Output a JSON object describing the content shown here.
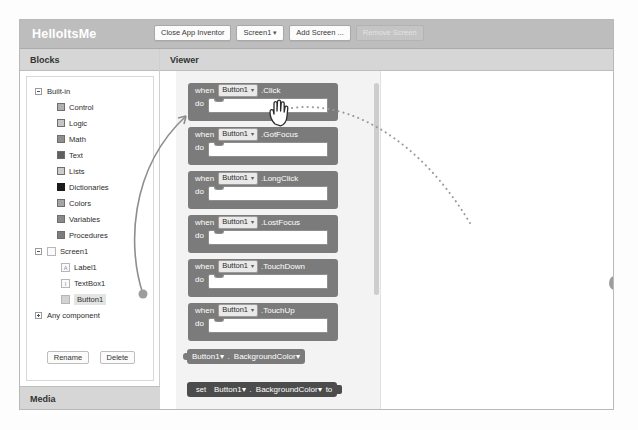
{
  "header": {
    "project_title": "HelloItsMe",
    "toolbar": [
      {
        "label": "Close App Inventor",
        "type": "button",
        "disabled": false
      },
      {
        "label": "Screen1",
        "type": "dropdown",
        "disabled": false
      },
      {
        "label": "Add Screen ...",
        "type": "button",
        "disabled": false
      },
      {
        "label": "Remove Screen",
        "type": "button",
        "disabled": true
      }
    ]
  },
  "blocks_panel": {
    "title": "Blocks",
    "tree": [
      {
        "label": "Built-in",
        "level": 0,
        "toggle": "minus"
      },
      {
        "label": "Control",
        "level": 1,
        "color": "#b0b0b0"
      },
      {
        "label": "Logic",
        "level": 1,
        "color": "#c6c6c6"
      },
      {
        "label": "Math",
        "level": 1,
        "color": "#8f8f8f"
      },
      {
        "label": "Text",
        "level": 1,
        "color": "#5f5f5f"
      },
      {
        "label": "Lists",
        "level": 1,
        "color": "#cccccc"
      },
      {
        "label": "Dictionaries",
        "level": 1,
        "color": "#1b1b1b"
      },
      {
        "label": "Colors",
        "level": 1,
        "color": "#a5a5a5"
      },
      {
        "label": "Variables",
        "level": 1,
        "color": "#8a8a8a"
      },
      {
        "label": "Procedures",
        "level": 1,
        "color": "#7d7d7d"
      },
      {
        "label": "Screen1",
        "level": 0,
        "toggle": "minus",
        "icon": ""
      },
      {
        "label": "Label1",
        "level": 2,
        "icon": "A"
      },
      {
        "label": "TextBox1",
        "level": 2,
        "icon": "I"
      },
      {
        "label": "Button1",
        "level": 2,
        "icon": "",
        "selected": true
      },
      {
        "label": "Any component",
        "level": 0,
        "toggle": "plus"
      }
    ],
    "rename_button": "Rename",
    "delete_button": "Delete",
    "media_title": "Media"
  },
  "viewer": {
    "title": "Viewer",
    "event_blocks": [
      {
        "keyword": "when",
        "component": "Button1",
        "event": ".Click",
        "body_label": "do"
      },
      {
        "keyword": "when",
        "component": "Button1",
        "event": ".GotFocus",
        "body_label": "do"
      },
      {
        "keyword": "when",
        "component": "Button1",
        "event": ".LongClick",
        "body_label": "do"
      },
      {
        "keyword": "when",
        "component": "Button1",
        "event": ".LostFocus",
        "body_label": "do"
      },
      {
        "keyword": "when",
        "component": "Button1",
        "event": ".TouchDown",
        "body_label": "do"
      },
      {
        "keyword": "when",
        "component": "Button1",
        "event": ".TouchUp",
        "body_label": "do"
      }
    ],
    "getter_block": {
      "component": "Button1",
      "separator": ".",
      "property": "BackgroundColor"
    },
    "setter_block": {
      "keyword": "set",
      "component": "Button1",
      "separator": ".",
      "property": "BackgroundColor",
      "to_label": "to"
    }
  },
  "annotations": {
    "cursor": "grab-hand-cursor",
    "drag_trail": "dotted-drag-path",
    "source_arrow": "curved-arrow-from-button1",
    "drop_target": "dashed-block-outline"
  },
  "colors": {
    "header_bar": "#bdbdbd",
    "panel_header": "#d6d6d6",
    "block_gray": "#7b7b7b",
    "block_dark": "#4c4c4c",
    "flyout_bg": "#f3f3f3"
  }
}
